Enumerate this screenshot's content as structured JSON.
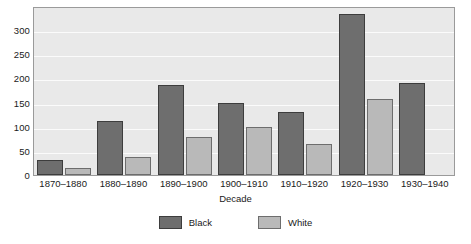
{
  "chart_data": {
    "type": "bar",
    "title": "",
    "subtitle": "",
    "xlabel": "Decade",
    "ylabel": "",
    "categories": [
      "1870–1880",
      "1880–1890",
      "1890–1900",
      "1900–1910",
      "1910–1920",
      "1920–1930",
      "1930–1940"
    ],
    "series": [
      {
        "name": "Black",
        "color": "#6e6e6e",
        "values": [
          32,
          112,
          187,
          150,
          131,
          334,
          191
        ]
      },
      {
        "name": "White",
        "color": "#b9b9b9",
        "values": [
          15,
          38,
          78,
          100,
          65,
          157,
          0
        ]
      }
    ],
    "ylim": [
      0,
      350
    ],
    "yticks": [
      0,
      50,
      100,
      150,
      200,
      250,
      300
    ],
    "ytick_labels": [
      "0",
      "50",
      "100",
      "150",
      "200",
      "250",
      "300"
    ],
    "grid": "horizontal",
    "grid_color": "#fbfbfb",
    "plot_background": "#e9e9e9",
    "figure_background": "#ffffff",
    "legend": {
      "position": "bottom-center",
      "entries": [
        {
          "label": "Black",
          "color": "#6e6e6e"
        },
        {
          "label": "White",
          "color": "#b9b9b9"
        }
      ]
    }
  }
}
